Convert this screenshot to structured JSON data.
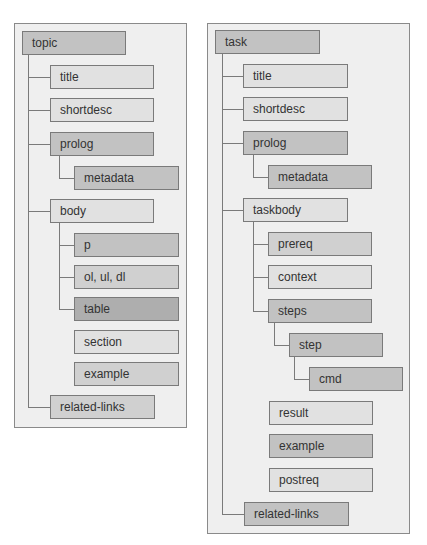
{
  "topic_tree": {
    "root": "topic",
    "nodes": {
      "title": "title",
      "shortdesc": "shortdesc",
      "prolog": "prolog",
      "metadata": "metadata",
      "body": "body",
      "p": "p",
      "lists": "ol, ul, dl",
      "table": "table",
      "section": "section",
      "example": "example",
      "related_links": "related-links"
    }
  },
  "task_tree": {
    "root": "task",
    "nodes": {
      "title": "title",
      "shortdesc": "shortdesc",
      "prolog": "prolog",
      "metadata": "metadata",
      "taskbody": "taskbody",
      "prereq": "prereq",
      "context": "context",
      "steps": "steps",
      "step": "step",
      "cmd": "cmd",
      "result": "result",
      "example": "example",
      "postreq": "postreq",
      "related_links": "related-links"
    }
  }
}
